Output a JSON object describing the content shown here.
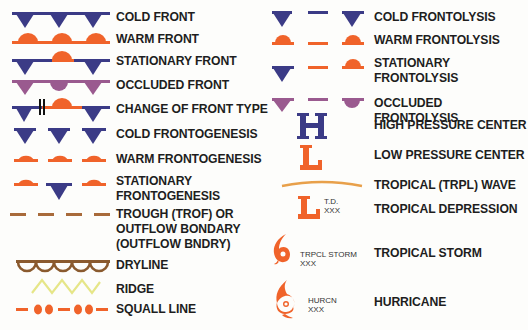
{
  "colors": {
    "cold": "#3b3b86",
    "warm": "#f0632a",
    "occluded": "#9a5a8f",
    "trough": "#a86a3a",
    "dryline": "#8a5a2e",
    "ridge": "#e8e88a",
    "squall": "#f0632a",
    "tropical_wave": "#e8a04a"
  },
  "left_column": [
    {
      "id": "cold-front",
      "label": "COLD FRONT"
    },
    {
      "id": "warm-front",
      "label": "WARM FRONT"
    },
    {
      "id": "stationary-front",
      "label": "STATIONARY FRONT"
    },
    {
      "id": "occluded-front",
      "label": "OCCLUDED FRONT"
    },
    {
      "id": "change-of-front-type",
      "label": "CHANGE OF FRONT TYPE"
    },
    {
      "id": "cold-frontogenesis",
      "label": "COLD FRONTOGENESIS"
    },
    {
      "id": "warm-frontogenesis",
      "label": "WARM FRONTOGENESIS"
    },
    {
      "id": "stationary-frontogenesis",
      "label_lines": [
        "STATIONARY",
        "FRONTOGENESIS"
      ]
    },
    {
      "id": "trough",
      "label_lines": [
        "TROUGH (TROF) OR",
        "OUTFLOW BONDARY",
        "(OUTFLOW BNDRY)"
      ]
    },
    {
      "id": "dryline",
      "label": "DRYLINE"
    },
    {
      "id": "ridge",
      "label": "RIDGE"
    },
    {
      "id": "squall-line",
      "label": "SQUALL LINE"
    }
  ],
  "right_column": [
    {
      "id": "cold-frontolysis",
      "label": "COLD FRONTOLYSIS"
    },
    {
      "id": "warm-frontolysis",
      "label": "WARM FRONTOLYSIS"
    },
    {
      "id": "stationary-frontolysis",
      "label_lines": [
        "STATIONARY",
        "FRONTOLYSIS"
      ]
    },
    {
      "id": "occluded-frontolysis",
      "label": "OCCLUDED FRONTOLYSIS"
    },
    {
      "id": "high-pressure-center",
      "label": "HIGH PRESSURE CENTER",
      "glyph": "H"
    },
    {
      "id": "low-pressure-center",
      "label": "LOW PRESSURE CENTER",
      "glyph": "L"
    },
    {
      "id": "tropical-wave",
      "label": "TROPICAL (TRPL) WAVE"
    },
    {
      "id": "tropical-depression",
      "label": "TROPICAL DEPRESSION",
      "glyph": "L",
      "annotation_lines": [
        "T.D.",
        "XXX"
      ]
    },
    {
      "id": "tropical-storm",
      "label": "TROPICAL STORM",
      "annotation_lines": [
        "TRPCL STORM",
        "XXX"
      ]
    },
    {
      "id": "hurricane",
      "label": "HURRICANE",
      "annotation_lines": [
        "HURCN",
        "XXX"
      ]
    }
  ]
}
